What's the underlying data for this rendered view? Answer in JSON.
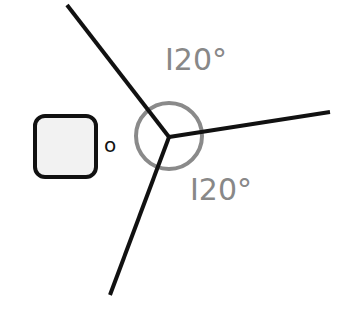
{
  "diagram": {
    "angle_labels": [
      "I20°",
      "I20°"
    ],
    "degree_symbol_label": "o",
    "colors": {
      "lines": "#111111",
      "circle": "#8a8a8a",
      "labels": "#888888",
      "square_fill": "#f2f2f2",
      "square_stroke": "#111111"
    }
  }
}
